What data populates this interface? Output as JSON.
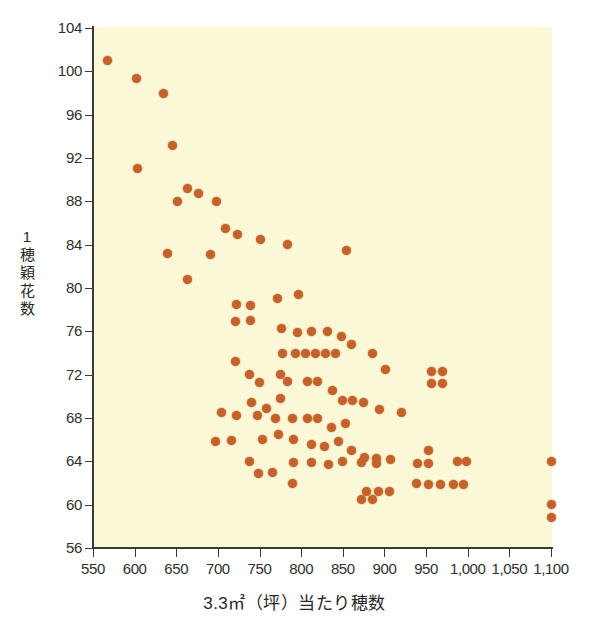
{
  "chart_data": {
    "type": "scatter",
    "title": "",
    "xlabel": "3.3㎡（坪）当たり穂数",
    "ylabel": "1穂穎花数",
    "xlim": [
      550,
      1100
    ],
    "ylim": [
      56,
      104
    ],
    "xticks": [
      550,
      600,
      650,
      700,
      750,
      800,
      850,
      900,
      950,
      1000,
      1050,
      1100
    ],
    "xticklabels": [
      "550",
      "600",
      "650",
      "700",
      "750",
      "800",
      "850",
      "900",
      "950",
      "1,000",
      "1,050",
      "1,100"
    ],
    "yticks": [
      56,
      60,
      64,
      68,
      72,
      76,
      80,
      84,
      88,
      92,
      96,
      100,
      104
    ],
    "yticklabels": [
      "56",
      "60",
      "64",
      "68",
      "72",
      "76",
      "80",
      "84",
      "88",
      "92",
      "96",
      "100",
      "104"
    ],
    "grid": false,
    "legend": false,
    "marker_color": "#c4622b",
    "plot_background": "#fbf8d8",
    "points": [
      [
        568,
        101.0
      ],
      [
        602,
        99.3
      ],
      [
        635,
        98.0
      ],
      [
        646,
        93.2
      ],
      [
        604,
        91.0
      ],
      [
        651,
        88.0
      ],
      [
        663,
        89.2
      ],
      [
        677,
        88.7
      ],
      [
        698,
        88.0
      ],
      [
        640,
        83.2
      ],
      [
        663,
        80.8
      ],
      [
        691,
        83.1
      ],
      [
        709,
        85.5
      ],
      [
        723,
        84.9
      ],
      [
        751,
        84.5
      ],
      [
        784,
        84.0
      ],
      [
        855,
        83.5
      ],
      [
        722,
        78.5
      ],
      [
        739,
        78.4
      ],
      [
        772,
        79.0
      ],
      [
        721,
        76.9
      ],
      [
        739,
        77.0
      ],
      [
        797,
        79.4
      ],
      [
        721,
        73.2
      ],
      [
        738,
        72.0
      ],
      [
        776,
        76.3
      ],
      [
        795,
        75.9
      ],
      [
        812,
        76.0
      ],
      [
        832,
        76.0
      ],
      [
        849,
        75.5
      ],
      [
        861,
        74.8
      ],
      [
        750,
        71.3
      ],
      [
        777,
        74.0
      ],
      [
        793,
        74.0
      ],
      [
        805,
        74.0
      ],
      [
        817,
        74.0
      ],
      [
        829,
        74.0
      ],
      [
        841,
        74.0
      ],
      [
        886,
        74.0
      ],
      [
        901,
        72.5
      ],
      [
        957,
        72.3
      ],
      [
        970,
        72.3
      ],
      [
        957,
        71.2
      ],
      [
        970,
        71.2
      ],
      [
        775,
        72.0
      ],
      [
        704,
        68.5
      ],
      [
        722,
        68.2
      ],
      [
        740,
        69.4
      ],
      [
        758,
        68.9
      ],
      [
        775,
        69.8
      ],
      [
        784,
        71.4
      ],
      [
        808,
        71.4
      ],
      [
        820,
        71.4
      ],
      [
        838,
        70.5
      ],
      [
        850,
        69.6
      ],
      [
        862,
        69.6
      ],
      [
        875,
        69.4
      ],
      [
        894,
        68.8
      ],
      [
        697,
        65.8
      ],
      [
        716,
        65.9
      ],
      [
        738,
        64.0
      ],
      [
        748,
        68.2
      ],
      [
        769,
        68.0
      ],
      [
        790,
        68.0
      ],
      [
        808,
        68.0
      ],
      [
        820,
        68.0
      ],
      [
        836,
        67.1
      ],
      [
        853,
        67.5
      ],
      [
        754,
        66.0
      ],
      [
        773,
        66.5
      ],
      [
        791,
        66.0
      ],
      [
        812,
        65.6
      ],
      [
        828,
        65.4
      ],
      [
        845,
        65.8
      ],
      [
        861,
        65.0
      ],
      [
        876,
        64.4
      ],
      [
        890,
        64.3
      ],
      [
        907,
        64.2
      ],
      [
        791,
        63.9
      ],
      [
        812,
        63.9
      ],
      [
        833,
        63.7
      ],
      [
        850,
        64.0
      ],
      [
        872,
        63.9
      ],
      [
        890,
        63.8
      ],
      [
        749,
        62.9
      ],
      [
        766,
        63.0
      ],
      [
        790,
        62.0
      ],
      [
        878,
        61.2
      ],
      [
        893,
        61.2
      ],
      [
        906,
        61.2
      ],
      [
        872,
        60.5
      ],
      [
        886,
        60.5
      ],
      [
        938,
        62.0
      ],
      [
        953,
        61.9
      ],
      [
        967,
        61.9
      ],
      [
        983,
        61.9
      ],
      [
        995,
        61.9
      ],
      [
        940,
        63.8
      ],
      [
        953,
        63.8
      ],
      [
        988,
        64.0
      ],
      [
        998,
        64.0
      ],
      [
        953,
        65.0
      ],
      [
        920,
        68.5
      ],
      [
        1100,
        64.0
      ],
      [
        1100,
        60.0
      ],
      [
        1100,
        58.8
      ]
    ]
  },
  "axes": {
    "x_title": "3.3㎡（坪）当たり穂数",
    "y_title_chars": [
      "1",
      "穂",
      "穎",
      "花",
      "数"
    ]
  }
}
